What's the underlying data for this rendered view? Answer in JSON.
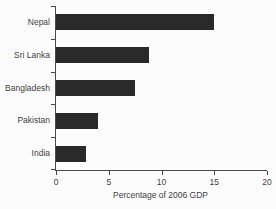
{
  "figure": {
    "background_color": "#fcfcfc"
  },
  "chart_data": {
    "type": "bar",
    "orientation": "horizontal",
    "title": "",
    "categories": [
      "Nepal",
      "Sri Lanka",
      "Bangladesh",
      "Pakistan",
      "India"
    ],
    "values": [
      15,
      8.8,
      7.5,
      4,
      2.8
    ],
    "xlabel": "Percentage of 2006 GDP",
    "ylabel": "",
    "xlim": [
      0,
      20
    ],
    "xticks": [
      0,
      5,
      10,
      15,
      20
    ],
    "xtick_labels": [
      "0",
      "5",
      "10",
      "15",
      "20"
    ],
    "bar_color": "#2a2a2a",
    "axis_color": "#4a4a4a",
    "text_color": "#3f3f3f",
    "grid": false,
    "legend": "none"
  }
}
